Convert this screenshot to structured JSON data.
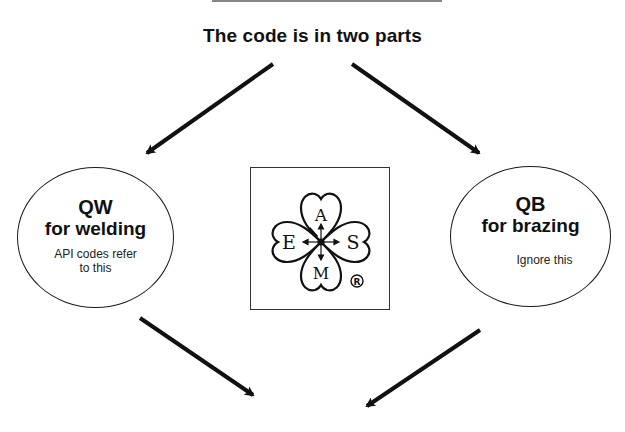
{
  "diagram": {
    "title": "The code is in two parts",
    "nodes": [
      {
        "id": "qw",
        "code": "QW",
        "purpose": "for welding",
        "note_line1": "API codes refer",
        "note_line2": "to this"
      },
      {
        "id": "qb",
        "code": "QB",
        "purpose": "for brazing",
        "note_line1": "Ignore this"
      }
    ],
    "logo": {
      "letters": {
        "top": "A",
        "left": "E",
        "right": "S",
        "bottom": "M"
      },
      "registered_mark": "®"
    },
    "arrows": [
      {
        "from": "title",
        "to": "qw"
      },
      {
        "from": "title",
        "to": "qb"
      },
      {
        "from": "qw",
        "to": "below"
      },
      {
        "from": "qb",
        "to": "below"
      }
    ],
    "colors": {
      "ink": "#111111",
      "background": "#ffffff"
    }
  }
}
